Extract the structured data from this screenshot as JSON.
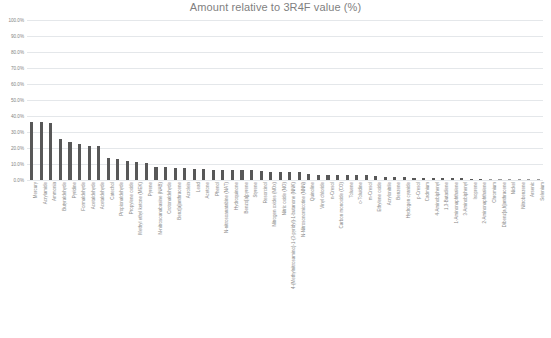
{
  "chart": {
    "title": "Amount relative to 3R4F value (%)",
    "bar_color": "#585858",
    "grid_color": "#e4e7ea",
    "text_color": "#8a8a8a"
  },
  "chart_data": {
    "type": "bar",
    "title": "Amount relative to 3R4F value (%)",
    "xlabel": "",
    "ylabel": "",
    "ylim": [
      0,
      100
    ],
    "grid": true,
    "legend": false,
    "ytick_labels": [
      "100.0%",
      "90.0%",
      "80.0%",
      "70.0%",
      "60.0%",
      "50.0%",
      "40.0%",
      "30.0%",
      "20.0%",
      "10.0%",
      "0.0%"
    ],
    "ytick_values": [
      100,
      90,
      80,
      70,
      60,
      50,
      40,
      30,
      20,
      10,
      0
    ],
    "categories": [
      "Mercury",
      "Acrylamide",
      "Ammonia",
      "Butyraldehyde",
      "Pyridine",
      "Formaldehyde",
      "Acetaldehyde",
      "Acetaldehyde",
      "Catechol",
      "Propionaldehyde",
      "Propylene oxide",
      "Methyl ethyl ketone (MEK)",
      "Pyrene",
      "N-nitrosoanabasine (NAB)",
      "Crotonaldehyde",
      "Benz[a]anthracene",
      "Acrolein",
      "Lead",
      "Acetone",
      "Phenol",
      "N-nitrosoanatabine (NAT)",
      "Hydroquinone",
      "Benzo[a]pyrene",
      "Styrene",
      "Resorcinol",
      "Nitrogen oxides (NOx)",
      "Nitric oxide (NO)",
      "4-(Methylnitrosamino)-1-(3-pyridyl)-1-butanone (NNK)",
      "N-Nitrosonornicotine (NNN)",
      "Quinoline",
      "Vinyl chloride",
      "n-Cresol",
      "Carbon monoxide (CO)",
      "Toluene",
      "o-Toluidine",
      "m-Cresol",
      "Ethylene oxide",
      "Acrylonitrile",
      "Benzene",
      "Hydrogen cyanide",
      "p-Cresol",
      "Cadmium",
      "4-Aminobiphenyl",
      "1,3-Butadiene",
      "1-Aminonaphthalene",
      "3-Aminobiphenyl",
      "Isoprene",
      "2-Aminonaphthalene",
      "Chromium",
      "Dibenz[a,h]anthracene",
      "Nickel",
      "Nitrobenzene",
      "Arsenic",
      "Selenium"
    ],
    "values": [
      36.5,
      36.0,
      35.8,
      25.5,
      23.5,
      22.5,
      21.5,
      21.3,
      13.5,
      13.0,
      12.0,
      11.5,
      10.5,
      8.0,
      8.0,
      7.8,
      7.5,
      7.0,
      6.8,
      6.5,
      6.3,
      6.2,
      6.0,
      6.0,
      5.8,
      5.0,
      5.0,
      5.0,
      4.8,
      3.5,
      3.2,
      3.0,
      3.0,
      3.0,
      3.0,
      3.0,
      2.8,
      2.0,
      2.0,
      2.0,
      1.5,
      1.5,
      1.2,
      1.0,
      1.0,
      1.0,
      0.8,
      0.8,
      0.6,
      0.5,
      0.5,
      0.4,
      0.3,
      0.3
    ]
  }
}
